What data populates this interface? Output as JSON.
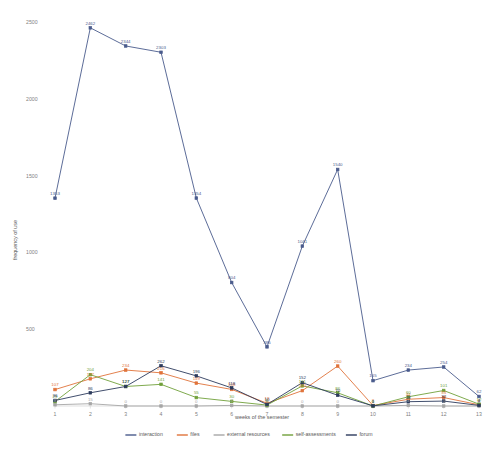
{
  "chart_data": {
    "type": "line",
    "title": "",
    "xlabel": "weeks of the semester",
    "ylabel": "frequency of use",
    "x": [
      1,
      2,
      3,
      4,
      5,
      6,
      7,
      8,
      9,
      10,
      11,
      12,
      13
    ],
    "categories": [
      "1",
      "2",
      "3",
      "4",
      "5",
      "6",
      "7",
      "8",
      "9",
      "10",
      "11",
      "12",
      "13"
    ],
    "ylim": [
      0,
      2500
    ],
    "yticks": [
      0,
      500,
      1000,
      1500,
      2000,
      2500
    ],
    "ytick_labels": [
      "",
      "500",
      "1000",
      "1500",
      "2000",
      "2500"
    ],
    "grid": false,
    "legend_position": "bottom",
    "series": [
      {
        "name": "interaction",
        "color": "#4a5b8c",
        "values": [
          1353,
          2462,
          2344,
          2303,
          1354,
          804,
          385,
          1041,
          1540,
          165,
          234,
          254,
          62
        ],
        "labels": [
          "1353",
          "2462",
          "2344",
          "2303",
          "1354",
          "804",
          "385",
          "1041",
          "1540",
          "165",
          "234",
          "254",
          "62"
        ]
      },
      {
        "name": "files",
        "color": "#e0733a",
        "values": [
          107,
          177,
          234,
          216,
          149,
          108,
          18,
          100,
          260,
          3,
          44,
          55,
          8
        ],
        "labels": [
          "107",
          "177",
          "234",
          "216",
          "149",
          "108",
          "18",
          "100",
          "260",
          "3",
          "44",
          "55",
          "8"
        ]
      },
      {
        "name": "external resources",
        "color": "#a6a6a6",
        "values": [
          8,
          15,
          0,
          0,
          0,
          4,
          0,
          0,
          0,
          0,
          4,
          0,
          0
        ],
        "labels": [
          "8",
          "15",
          "0",
          "0",
          "0",
          "4",
          "0",
          "0",
          "0",
          "0",
          "4",
          "0",
          "0"
        ]
      },
      {
        "name": "self-assessments",
        "color": "#70a03a",
        "values": [
          29,
          204,
          127,
          141,
          55,
          30,
          6,
          131,
          86,
          0,
          60,
          101,
          12
        ],
        "labels": [
          "29",
          "204",
          "127",
          "141",
          "55",
          "30",
          "6",
          "131",
          "86",
          "0",
          "60",
          "101",
          "12"
        ]
      },
      {
        "name": "forum",
        "color": "#2b3a5c",
        "values": [
          36,
          86,
          127,
          262,
          196,
          118,
          10,
          152,
          70,
          1,
          28,
          32,
          4
        ],
        "labels": [
          "36",
          "86",
          "127",
          "262",
          "196",
          "118",
          "10",
          "152",
          "70",
          "1",
          "28",
          "32",
          "4"
        ]
      }
    ]
  },
  "axes": {
    "y_title": "frequency of use",
    "x_title": "weeks of the semester"
  },
  "legend": {
    "items": [
      {
        "label": "interaction",
        "color": "#4a5b8c"
      },
      {
        "label": "files",
        "color": "#e0733a"
      },
      {
        "label": "external resources",
        "color": "#a6a6a6"
      },
      {
        "label": "self-assessments",
        "color": "#70a03a"
      },
      {
        "label": "forum",
        "color": "#2b3a5c"
      }
    ]
  }
}
